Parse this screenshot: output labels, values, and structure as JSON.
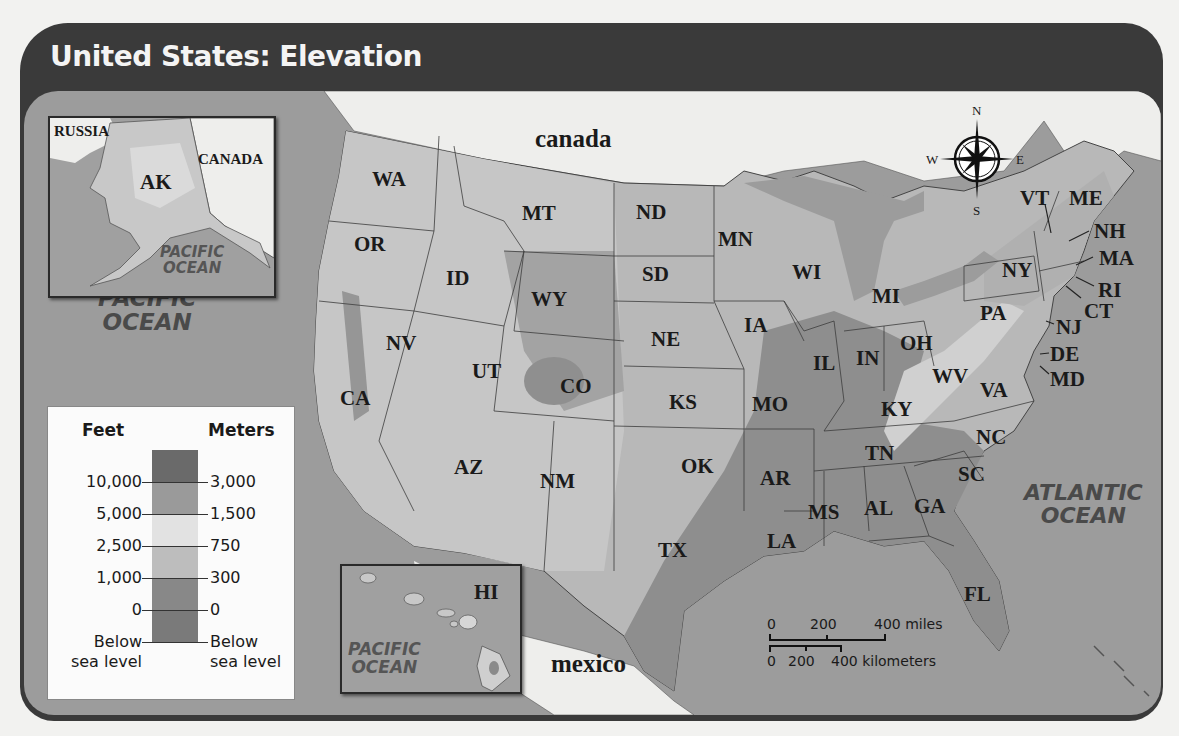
{
  "title": "United States: Elevation",
  "countries": {
    "canada": "canada",
    "mexico": "mexico"
  },
  "oceans": {
    "pacific_main": [
      "PACIFIC",
      "OCEAN"
    ],
    "atlantic": [
      "ATLANTIC",
      "OCEAN"
    ]
  },
  "alaska_inset": {
    "state": "AK",
    "russia": "RUSSIA",
    "canada": "CANADA",
    "ocean": [
      "PACIFIC",
      "OCEAN"
    ]
  },
  "hawaii_inset": {
    "state": "HI",
    "ocean": [
      "PACIFIC",
      "OCEAN"
    ]
  },
  "states": [
    {
      "abbr": "WA",
      "x": 348,
      "y": 78
    },
    {
      "abbr": "OR",
      "x": 330,
      "y": 143
    },
    {
      "abbr": "CA",
      "x": 316,
      "y": 297
    },
    {
      "abbr": "NV",
      "x": 362,
      "y": 242
    },
    {
      "abbr": "ID",
      "x": 422,
      "y": 177
    },
    {
      "abbr": "MT",
      "x": 498,
      "y": 112
    },
    {
      "abbr": "WY",
      "x": 507,
      "y": 198
    },
    {
      "abbr": "UT",
      "x": 448,
      "y": 270
    },
    {
      "abbr": "CO",
      "x": 536,
      "y": 285
    },
    {
      "abbr": "AZ",
      "x": 430,
      "y": 366
    },
    {
      "abbr": "NM",
      "x": 516,
      "y": 380
    },
    {
      "abbr": "ND",
      "x": 612,
      "y": 111
    },
    {
      "abbr": "SD",
      "x": 618,
      "y": 173
    },
    {
      "abbr": "NE",
      "x": 627,
      "y": 238
    },
    {
      "abbr": "KS",
      "x": 645,
      "y": 301
    },
    {
      "abbr": "OK",
      "x": 657,
      "y": 365
    },
    {
      "abbr": "TX",
      "x": 634,
      "y": 449
    },
    {
      "abbr": "MN",
      "x": 694,
      "y": 138
    },
    {
      "abbr": "IA",
      "x": 720,
      "y": 224
    },
    {
      "abbr": "MO",
      "x": 728,
      "y": 303
    },
    {
      "abbr": "AR",
      "x": 736,
      "y": 377
    },
    {
      "abbr": "LA",
      "x": 743,
      "y": 440
    },
    {
      "abbr": "WI",
      "x": 768,
      "y": 171
    },
    {
      "abbr": "IL",
      "x": 789,
      "y": 262
    },
    {
      "abbr": "MI",
      "x": 848,
      "y": 195
    },
    {
      "abbr": "IN",
      "x": 832,
      "y": 257
    },
    {
      "abbr": "OH",
      "x": 876,
      "y": 242
    },
    {
      "abbr": "KY",
      "x": 857,
      "y": 308
    },
    {
      "abbr": "TN",
      "x": 841,
      "y": 352
    },
    {
      "abbr": "MS",
      "x": 784,
      "y": 411
    },
    {
      "abbr": "AL",
      "x": 840,
      "y": 407
    },
    {
      "abbr": "GA",
      "x": 890,
      "y": 405
    },
    {
      "abbr": "FL",
      "x": 940,
      "y": 493
    },
    {
      "abbr": "SC",
      "x": 934,
      "y": 373
    },
    {
      "abbr": "NC",
      "x": 952,
      "y": 336
    },
    {
      "abbr": "VA",
      "x": 956,
      "y": 289
    },
    {
      "abbr": "WV",
      "x": 908,
      "y": 275
    },
    {
      "abbr": "PA",
      "x": 956,
      "y": 212
    },
    {
      "abbr": "NY",
      "x": 978,
      "y": 169
    },
    {
      "abbr": "VT",
      "x": 996,
      "y": 97
    },
    {
      "abbr": "ME",
      "x": 1045,
      "y": 97
    },
    {
      "abbr": "NH",
      "x": 1070,
      "y": 130
    },
    {
      "abbr": "MA",
      "x": 1075,
      "y": 157
    },
    {
      "abbr": "RI",
      "x": 1074,
      "y": 189
    },
    {
      "abbr": "CT",
      "x": 1060,
      "y": 210
    },
    {
      "abbr": "NJ",
      "x": 1032,
      "y": 226
    },
    {
      "abbr": "DE",
      "x": 1026,
      "y": 253
    },
    {
      "abbr": "MD",
      "x": 1026,
      "y": 278
    }
  ],
  "compass": {
    "n": "N",
    "s": "S",
    "e": "E",
    "w": "W"
  },
  "scale_bar": {
    "miles": [
      "0",
      "200",
      "400 miles"
    ],
    "kilometers": [
      "0",
      "200",
      "400 kilometers"
    ]
  },
  "legend": {
    "feet_header": "Feet",
    "meters_header": "Meters",
    "feet_ticks": [
      "10,000",
      "5,000",
      "2,500",
      "1,000",
      "0",
      "Below",
      "sea level"
    ],
    "meters_ticks": [
      "3,000",
      "1,500",
      "750",
      "300",
      "0",
      "Below",
      "sea level"
    ],
    "band_colors": [
      "#6a6a6a",
      "#9a9a9a",
      "#e2e2e2",
      "#bdbdbd",
      "#888888",
      "#7a7a7a"
    ]
  },
  "colors": {
    "frame": "#3a3a3a",
    "ocean": "#9c9c9c",
    "foreign_land": "#eeeeec",
    "highland": "#c4c4c4",
    "plains": "#b8b8b8",
    "lowland": "#8e8e8e"
  }
}
